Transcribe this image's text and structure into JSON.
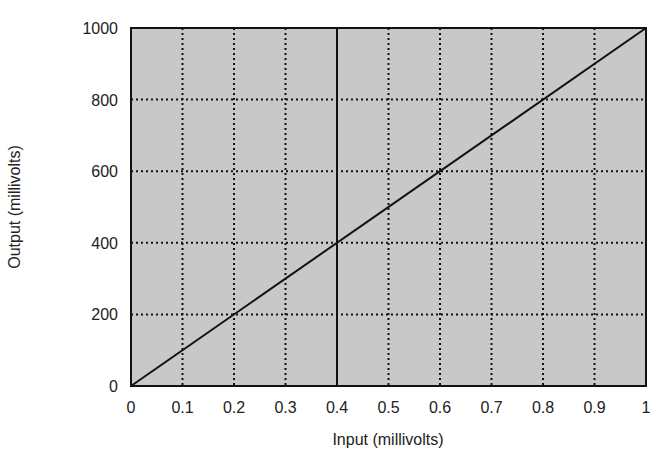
{
  "chart_data": {
    "type": "line",
    "title": "",
    "xlabel": "Input (millivolts)",
    "ylabel": "Output (millivolts)",
    "xlim": [
      0,
      1
    ],
    "ylim": [
      0,
      1000
    ],
    "x_ticks": [
      "0",
      "0.1",
      "0.2",
      "0.3",
      "0.4",
      "0.5",
      "0.6",
      "0.7",
      "0.8",
      "0.9",
      "1"
    ],
    "y_ticks": [
      "0",
      "200",
      "400",
      "600",
      "800",
      "1000"
    ],
    "grid": true,
    "grid_style": "dotted",
    "plot_background": "#c8c8c8",
    "series": [
      {
        "name": "Output vs Input",
        "x": [
          0,
          1
        ],
        "y": [
          0,
          1000
        ],
        "color": "#111111"
      }
    ],
    "annotations": [
      {
        "type": "vertical-line",
        "x": 0.4,
        "style": "solid"
      }
    ]
  }
}
